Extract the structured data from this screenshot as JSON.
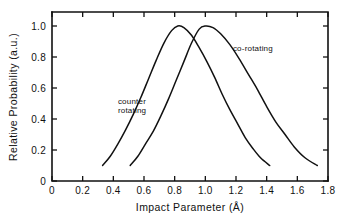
{
  "chart_data": {
    "type": "line",
    "title": "",
    "xlabel": "Impact Parameter (Å)",
    "ylabel": "Relative Probability (a.u.)",
    "xlim": [
      0,
      1.8
    ],
    "ylim": [
      0,
      1.05
    ],
    "xticks": [
      0,
      0.2,
      0.4,
      0.6,
      0.8,
      1.0,
      1.2,
      1.4,
      1.6,
      1.8
    ],
    "xticklabels": [
      "0",
      "0.2",
      "0.4",
      "0.6",
      "0.8",
      "1.0",
      "1.2",
      "1.4",
      "1.6",
      "1.8"
    ],
    "yticks": [
      0,
      0.2,
      0.4,
      0.6,
      0.8,
      1.0
    ],
    "yticklabels": [
      "0",
      "0.2",
      "0.4",
      "0.6",
      "0.8",
      "1.0"
    ],
    "grid": false,
    "legend": "inline-annotations",
    "line_color": "#111111",
    "background_color": "#ffffff",
    "series": [
      {
        "name": "counter rotating",
        "label_lines": [
          "counter",
          "rotating"
        ],
        "peak_x": 0.82,
        "peak_y": 1.0,
        "x": [
          0.33,
          0.38,
          0.43,
          0.48,
          0.53,
          0.58,
          0.63,
          0.68,
          0.73,
          0.78,
          0.82,
          0.86,
          0.91,
          0.96,
          1.01,
          1.06,
          1.11,
          1.16,
          1.21,
          1.26,
          1.31,
          1.36,
          1.42
        ],
        "y": [
          0.1,
          0.16,
          0.24,
          0.33,
          0.43,
          0.54,
          0.66,
          0.78,
          0.89,
          0.97,
          1.0,
          0.99,
          0.94,
          0.86,
          0.77,
          0.67,
          0.56,
          0.46,
          0.37,
          0.28,
          0.21,
          0.15,
          0.1
        ]
      },
      {
        "name": "co-rotating",
        "label_lines": [
          "co-rotating"
        ],
        "peak_x": 1.0,
        "peak_y": 1.0,
        "x": [
          0.51,
          0.56,
          0.61,
          0.66,
          0.71,
          0.76,
          0.81,
          0.86,
          0.91,
          0.96,
          1.0,
          1.05,
          1.1,
          1.16,
          1.22,
          1.28,
          1.34,
          1.4,
          1.46,
          1.52,
          1.58,
          1.65,
          1.73
        ],
        "y": [
          0.1,
          0.16,
          0.24,
          0.32,
          0.42,
          0.53,
          0.65,
          0.77,
          0.89,
          0.98,
          1.0,
          0.99,
          0.95,
          0.88,
          0.79,
          0.69,
          0.59,
          0.48,
          0.38,
          0.3,
          0.22,
          0.15,
          0.1
        ]
      }
    ],
    "annotations": [
      {
        "text": "co-rotating",
        "x": 1.18,
        "y": 0.84
      },
      {
        "text": "counter",
        "x": 0.43,
        "y": 0.5
      },
      {
        "text": "rotating",
        "x": 0.43,
        "y": 0.44
      }
    ]
  }
}
